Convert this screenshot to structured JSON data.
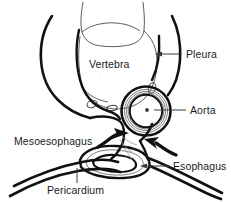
{
  "figure": {
    "background_color": "#ffffff",
    "ink_color": "#111111",
    "thin_line_color": "#4a4a4a"
  },
  "labels": {
    "vertebra": "Vertebra",
    "pleura": "Pleura",
    "aorta": "Aorta",
    "mesoesophagus": "Mesoesophagus",
    "esophagus": "Esophagus",
    "pericardium": "Pericardium"
  },
  "structures": [
    {
      "name": "vertebra",
      "label": "Vertebra",
      "description": "large rounded vertebral body outlined with thin line at top center"
    },
    {
      "name": "pleura",
      "label": "Pleura",
      "description": "thick curved lines running down the left and right sides"
    },
    {
      "name": "aorta",
      "label": "Aorta",
      "description": "circular vessel with concentric wall rings at center right"
    },
    {
      "name": "mesoesophagus",
      "label": "Mesoesophagus",
      "description": "connective tissue plane between aorta and esophagus, indicated by thick arrows"
    },
    {
      "name": "esophagus",
      "label": "Esophagus",
      "description": "flattened slit-like lumen below the aorta"
    },
    {
      "name": "pericardium",
      "label": "Pericardium",
      "description": "thick curved line sweeping across the bottom"
    }
  ],
  "annotations": {
    "pleura_leader": "arrow leader pointing left to pleural line",
    "aorta_leader": "arrow leader pointing left to aorta lumen",
    "esophagus_leader": "arrow leader pointing left to esophageal lumen",
    "pericardium_leader": "vertical leader pointing up to pericardial line",
    "mesoesophagus_arrow_left": "thick curved arrow pointing right into the mesoesophagus",
    "mesoesophagus_arrow_right": "thick curved arrow pointing left into the mesoesophagus"
  }
}
